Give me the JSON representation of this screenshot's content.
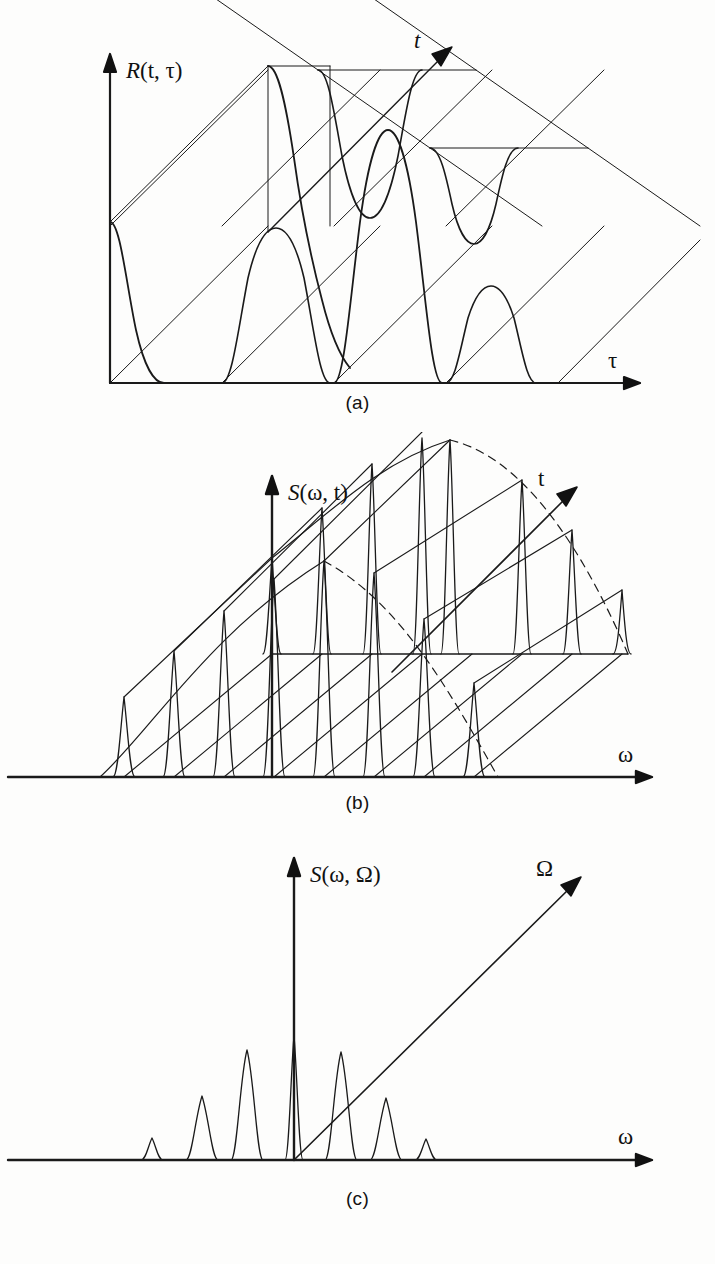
{
  "figure": {
    "background_color": "#fdfdfc",
    "ink_color": "#111111",
    "curve_color": "#1a1a1a",
    "panels": [
      {
        "id": "a",
        "caption": "(a)",
        "vertical_axis_label": "R(t, τ)",
        "horizontal_axis_label": "τ",
        "depth_axis_label": "t",
        "description": "time-varying autocorrelation surface"
      },
      {
        "id": "b",
        "caption": "(b)",
        "vertical_axis_label": "S(ω, t)",
        "horizontal_axis_label": "ω",
        "depth_axis_label": "t",
        "description": "time-varying spectrum surface"
      },
      {
        "id": "c",
        "caption": "(c)",
        "vertical_axis_label": "S(ω, Ω)",
        "horizontal_axis_label": "ω",
        "depth_axis_label": "Ω",
        "description": "bifrequency spectrum"
      }
    ]
  },
  "chart_data": [
    {
      "type": "area",
      "panel": "a",
      "title": "R(t, τ)",
      "xlabel": "τ",
      "ylabel": "R(t, τ)",
      "zlabel": "t",
      "grid": false,
      "legend": "none",
      "note": "Four receding slabs in oblique projection; each slab carries one bell-shaped hump whose amplitude decays with depth t.",
      "slabs": [
        {
          "index": 0,
          "depth_offset_x": 0,
          "depth_offset_y": 0,
          "hump_center": 30,
          "hump_half_width": 54,
          "hump_height": 318,
          "baseline_height": 0
        },
        {
          "index": 1,
          "depth_offset_x": 112,
          "depth_offset_y": -78,
          "hump_center": 150,
          "hump_half_width": 54,
          "hump_height": 300,
          "baseline_height": 0
        },
        {
          "index": 2,
          "depth_offset_x": 224,
          "depth_offset_y": -156,
          "hump_center": 268,
          "hump_half_width": 52,
          "hump_height": 246,
          "baseline_height": 0
        },
        {
          "index": 3,
          "depth_offset_x": 336,
          "depth_offset_y": -234,
          "hump_center": 386,
          "hump_half_width": 46,
          "hump_height": 150,
          "baseline_height": 0
        }
      ],
      "front_humps": [
        {
          "center": 30,
          "half_width": 54,
          "height": 318
        },
        {
          "center": 150,
          "half_width": 54,
          "height": 300
        },
        {
          "center": 268,
          "half_width": 52,
          "height": 246
        },
        {
          "center": 386,
          "half_width": 46,
          "height": 150
        }
      ]
    },
    {
      "type": "line",
      "panel": "b",
      "title": "S(ω, t)",
      "xlabel": "ω",
      "ylabel": "S(ω, t)",
      "zlabel": "t",
      "grid": false,
      "legend": "none",
      "note": "Two rows of narrow spectral lines: a front row on the ω axis and a receded row on a raised plane. Peak tips are joined by diagonal t lines. Envelope solid on the rising flank, dashed on the falling flank.",
      "front_row": {
        "baseline_y": 0,
        "peaks": [
          {
            "x": 20,
            "height": 82,
            "half_width": 11
          },
          {
            "x": 70,
            "height": 128,
            "half_width": 11
          },
          {
            "x": 120,
            "height": 168,
            "half_width": 11
          },
          {
            "x": 170,
            "height": 200,
            "half_width": 11
          },
          {
            "x": 220,
            "height": 218,
            "half_width": 11
          },
          {
            "x": 270,
            "height": 206,
            "half_width": 11
          },
          {
            "x": 320,
            "height": 160,
            "half_width": 11
          },
          {
            "x": 370,
            "height": 96,
            "half_width": 11
          }
        ]
      },
      "back_row": {
        "baseline_y": 185,
        "peaks": [
          {
            "x": 132,
            "height": 96,
            "half_width": 10
          },
          {
            "x": 182,
            "height": 146,
            "half_width": 10
          },
          {
            "x": 232,
            "height": 190,
            "half_width": 10
          },
          {
            "x": 282,
            "height": 224,
            "half_width": 10
          },
          {
            "x": 332,
            "height": 244,
            "half_width": 10
          },
          {
            "x": 382,
            "height": 226,
            "half_width": 10
          },
          {
            "x": 432,
            "height": 176,
            "half_width": 10
          },
          {
            "x": 482,
            "height": 108,
            "half_width": 10
          }
        ]
      },
      "envelope": {
        "solid_side": "left",
        "dashed_side": "right"
      }
    },
    {
      "type": "bar",
      "panel": "c",
      "title": "S(ω, Ω)",
      "xlabel": "ω",
      "ylabel": "S(ω, Ω)",
      "zlabel": "Ω",
      "grid": false,
      "legend": "none",
      "note": "Seven narrow symmetric spectral lines centred on the origin; the central line coincides with the vertical axis.",
      "categories": [
        "-3",
        "-2",
        "-1",
        "0",
        "+1",
        "+2",
        "+3"
      ],
      "values": [
        22,
        64,
        110,
        124,
        108,
        62,
        21
      ],
      "peaks": [
        {
          "x": -150,
          "height": 22,
          "half_width": 11
        },
        {
          "x": -100,
          "height": 64,
          "half_width": 13
        },
        {
          "x": -50,
          "height": 110,
          "half_width": 13
        },
        {
          "x": 0,
          "height": 124,
          "half_width": 9
        },
        {
          "x": 50,
          "height": 108,
          "half_width": 13
        },
        {
          "x": 100,
          "height": 62,
          "half_width": 13
        },
        {
          "x": 150,
          "height": 21,
          "half_width": 11
        }
      ]
    }
  ]
}
